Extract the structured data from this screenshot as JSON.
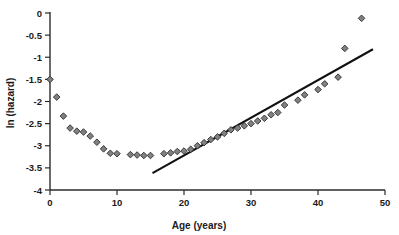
{
  "chart_data": {
    "type": "scatter",
    "title": "",
    "xlabel": "Age (years)",
    "ylabel": "ln (hazard)",
    "xlim": [
      0,
      50
    ],
    "ylim": [
      -4,
      0
    ],
    "grid": false,
    "legend": "none",
    "marker_style": "diamond",
    "marker_fill": "#808080",
    "marker_edge": "#2e2e2e",
    "xticks": [
      0,
      10,
      20,
      30,
      40,
      50
    ],
    "xticklabels": [
      "0",
      "10",
      "20",
      "30",
      "40",
      "50"
    ],
    "yticks": [
      0,
      -0.5,
      -1,
      -1.5,
      -2,
      -2.5,
      -3,
      -3.5,
      -4
    ],
    "yticklabels": [
      "0",
      "-0.5",
      "-1",
      "-1.5",
      "-2",
      "-2.5",
      "-3",
      "-3.5",
      "-4"
    ],
    "series": [
      {
        "name": "ln hazard by age",
        "type": "scatter",
        "x": [
          0,
          1,
          2,
          3,
          4,
          5,
          6,
          7,
          8,
          9,
          10,
          12,
          13,
          14,
          15,
          17,
          18,
          19,
          20,
          21,
          22,
          23,
          24,
          25,
          26,
          27,
          28,
          29,
          30,
          31,
          32,
          33,
          34,
          35,
          37,
          38,
          40,
          41,
          43,
          44,
          46.5
        ],
        "y": [
          -1.5,
          -1.9,
          -2.33,
          -2.6,
          -2.67,
          -2.69,
          -2.78,
          -2.92,
          -3.07,
          -3.17,
          -3.18,
          -3.2,
          -3.21,
          -3.22,
          -3.22,
          -3.18,
          -3.16,
          -3.13,
          -3.12,
          -3.08,
          -3.0,
          -2.93,
          -2.86,
          -2.8,
          -2.72,
          -2.64,
          -2.6,
          -2.55,
          -2.5,
          -2.44,
          -2.38,
          -2.3,
          -2.25,
          -2.08,
          -1.97,
          -1.85,
          -1.73,
          -1.6,
          -1.45,
          -0.8,
          -0.12
        ]
      }
    ],
    "annotations": [
      {
        "type": "fit-line",
        "name": "linear-trend-line",
        "x_start": 15.3,
        "y_start": -3.62,
        "x_end": 48.2,
        "y_end": -0.82
      }
    ]
  },
  "axis": {
    "x_title": "Age (years)",
    "y_title": "ln (hazard)"
  }
}
